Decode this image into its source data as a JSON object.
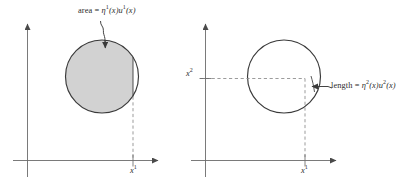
{
  "figure": {
    "title": "",
    "panels": [
      {
        "id": "left-panel",
        "name": "area-panel",
        "annotation_label": "area = η¹(x)u¹(x)",
        "annotation_prefix": "area = ",
        "annotation_eta": "η",
        "annotation_eta_sup": "1",
        "annotation_mid": "(x)",
        "annotation_u": "u",
        "annotation_u_sup": "1",
        "annotation_end": "(x)",
        "x_axis_label": "x",
        "x_axis_label_sup": "1",
        "y_axis_label": "",
        "shape": "filled-circle",
        "fill_color": "#d2d2d2",
        "stroke_color": "#3a3a3a"
      },
      {
        "id": "right-panel",
        "name": "length-panel",
        "annotation_label": "length = η²(x)u²(x)",
        "annotation_prefix": "length = ",
        "annotation_eta": "η",
        "annotation_eta_sup": "2",
        "annotation_mid": "(x)",
        "annotation_u": "u",
        "annotation_u_sup": "2",
        "annotation_end": "(x)",
        "x_axis_label": "x",
        "x_axis_label_sup": "1",
        "y_axis_label": "x",
        "y_axis_label_sup": "2",
        "shape": "outline-circle",
        "fill_color": "#ffffff",
        "stroke_color": "#3a3a3a"
      }
    ],
    "colors": {
      "axis": "#6b6b6b",
      "curve": "#3a3a3a",
      "fill": "#d2d2d2",
      "dashed": "#8a8a8a",
      "text": "#2b2b2b",
      "background": "#ffffff"
    }
  }
}
